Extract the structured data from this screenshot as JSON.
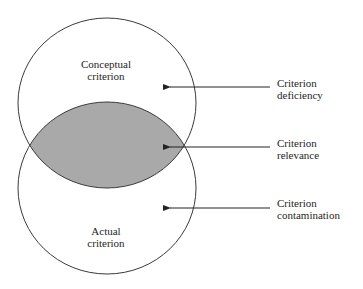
{
  "diagram": {
    "type": "venn",
    "circles": [
      {
        "id": "conceptual",
        "label_lines": [
          "Conceptual",
          "criterion"
        ]
      },
      {
        "id": "actual",
        "label_lines": [
          "Actual",
          "criterion"
        ]
      }
    ],
    "overlap_fill": "#a9a9a9",
    "callouts": [
      {
        "id": "deficiency",
        "lines": [
          "Criterion",
          "deficiency"
        ]
      },
      {
        "id": "relevance",
        "lines": [
          "Criterion",
          "relevance"
        ]
      },
      {
        "id": "contamination",
        "lines": [
          "Criterion",
          "contamination"
        ]
      }
    ]
  }
}
